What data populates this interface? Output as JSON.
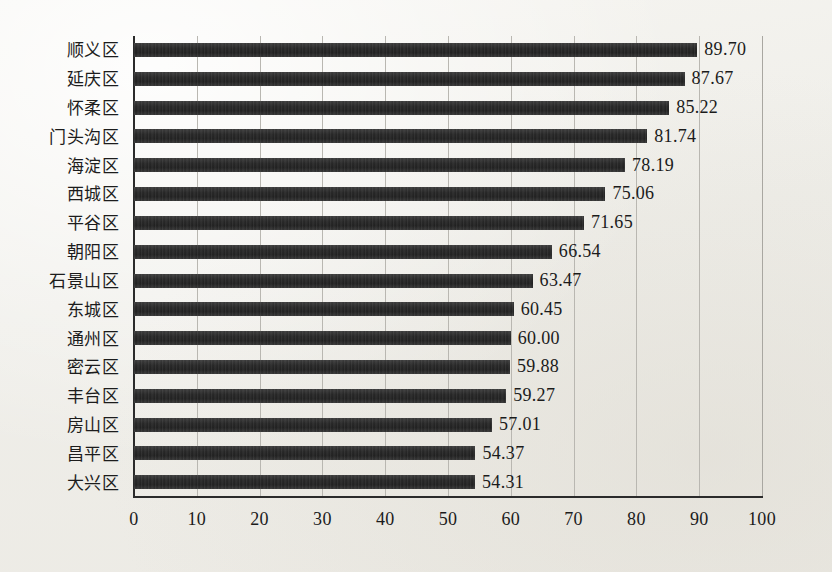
{
  "chart_data": {
    "type": "bar",
    "orientation": "horizontal",
    "title": "",
    "subtitle": "",
    "xlabel": "",
    "ylabel": "",
    "xlim": [
      0,
      100
    ],
    "xticks": [
      "0",
      "10",
      "20",
      "30",
      "40",
      "50",
      "60",
      "70",
      "80",
      "90",
      "100"
    ],
    "grid": true,
    "legend": false,
    "bar_color": "#242424",
    "axis_color": "#2b2b2b",
    "grid_color": "#b9b7b1",
    "background_color": "#f3f2ee",
    "categories": [
      "顺义区",
      "延庆区",
      "怀柔区",
      "门头沟区",
      "海淀区",
      "西城区",
      "平谷区",
      "朝阳区",
      "石景山区",
      "东城区",
      "通州区",
      "密云区",
      "丰台区",
      "房山区",
      "昌平区",
      "大兴区"
    ],
    "values": [
      89.7,
      87.67,
      85.22,
      81.74,
      78.19,
      75.06,
      71.65,
      66.54,
      63.47,
      60.45,
      60.0,
      59.88,
      59.27,
      57.01,
      54.37,
      54.31
    ],
    "value_labels": [
      "89.70",
      "87.67",
      "85.22",
      "81.74",
      "78.19",
      "75.06",
      "71.65",
      "66.54",
      "63.47",
      "60.45",
      "60.00",
      "59.88",
      "59.27",
      "57.01",
      "54.37",
      "54.31"
    ]
  }
}
